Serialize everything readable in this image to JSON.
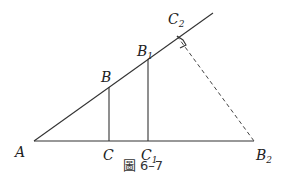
{
  "figure": {
    "caption": "圖 6–7",
    "points": {
      "A": {
        "name": "A",
        "sub": ""
      },
      "B": {
        "name": "B",
        "sub": ""
      },
      "C": {
        "name": "C",
        "sub": ""
      },
      "B1": {
        "name": "B",
        "sub": "1"
      },
      "C1": {
        "name": "C",
        "sub": "1"
      },
      "C2": {
        "name": "C",
        "sub": "2"
      },
      "B2": {
        "name": "B",
        "sub": "2"
      }
    }
  }
}
